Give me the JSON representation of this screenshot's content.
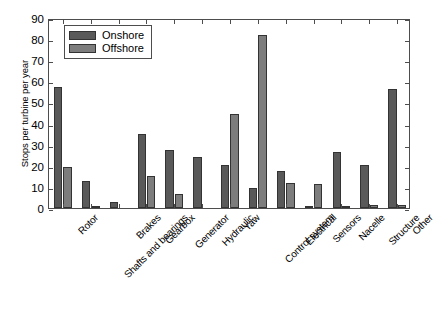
{
  "chart_data": {
    "type": "bar",
    "title": "",
    "xlabel": "",
    "ylabel": "Stops per turbine per year",
    "ylim": [
      0,
      90
    ],
    "yticks": [
      0,
      10,
      20,
      30,
      40,
      50,
      60,
      70,
      80,
      90
    ],
    "grid": false,
    "legend_position": "upper left",
    "categories": [
      "Rotor",
      "Shafts and bearings",
      "Brakes",
      "Gearbox",
      "Generator",
      "Hydraulic",
      "Yaw",
      "Control system",
      "Electrical",
      "Sensors",
      "Nacelle",
      "Structure",
      "Other"
    ],
    "series": [
      {
        "name": "Onshore",
        "color": "#595959",
        "values": [
          58,
          13,
          3,
          35.5,
          28,
          24.5,
          20.5,
          9.8,
          17.5,
          1,
          27,
          20.5,
          57
        ]
      },
      {
        "name": "Offshore",
        "color": "#7d7d7d",
        "values": [
          19.5,
          0.4,
          0,
          15.5,
          6.5,
          0,
          45,
          83,
          12,
          11.5,
          0.4,
          1.5,
          1.5
        ]
      }
    ]
  },
  "legend": {
    "items": [
      {
        "label": "Onshore"
      },
      {
        "label": "Offshore"
      }
    ]
  },
  "caption": {
    "text": ""
  }
}
